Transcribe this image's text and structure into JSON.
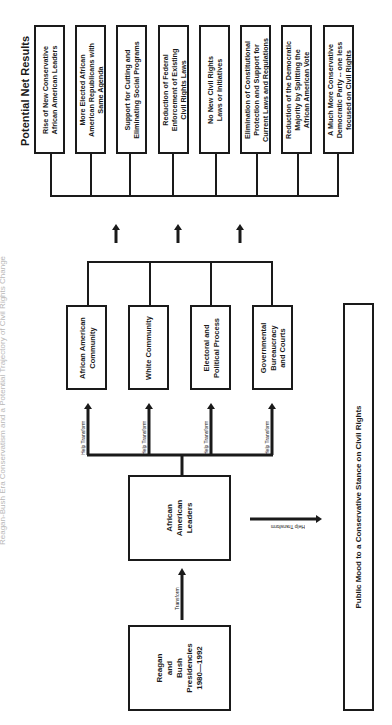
{
  "title": "Reagan-Bush Era Conservatism and a Potential Trajectory of Civil Rights Change",
  "results_heading": "Potential Net Results",
  "results": [
    {
      "line1": "Rise of New Conservative",
      "line2": "African American Leaders",
      "line3": ""
    },
    {
      "line1": "More Elected African",
      "line2": "American Republicans with",
      "line3": "Same Agenda"
    },
    {
      "line1": "Support for Cutting and",
      "line2": "Eliminating Social Programs",
      "line3": ""
    },
    {
      "line1": "Reduction of Federal",
      "line2": "Enforcement of Existing",
      "line3": "Civil Rights Laws"
    },
    {
      "line1": "No New Civil Rights",
      "line2": "Laws or Initiatives",
      "line3": ""
    },
    {
      "line1": "Elimination of Constitutional",
      "line2": "Protection and Support for",
      "line3": "Current Laws and Regulations"
    },
    {
      "line1": "Reduction of the Democratic",
      "line2": "Majority by Splitting the",
      "line3": "African American Vote"
    },
    {
      "line1": "A Much More Conservative",
      "line2": "Democratic Party -- one less",
      "line3": "focused on Civil Rights"
    }
  ],
  "targets": [
    {
      "line1": "African American",
      "line2": "Community",
      "line3": ""
    },
    {
      "line1": "White Community",
      "line2": "",
      "line3": ""
    },
    {
      "line1": "Electoral and",
      "line2": "Political Process",
      "line3": ""
    },
    {
      "line1": "Governmental",
      "line2": "Bureaucracy",
      "line3": "and Courts"
    }
  ],
  "help_transform_label": "Help Transform",
  "transform_label": "Transform",
  "leaders": {
    "line1": "African",
    "line2": "American",
    "line3": "Leaders"
  },
  "presidencies": {
    "line1": "Reagan",
    "line2": "and",
    "line3": "Bush",
    "line4": "Presidencies",
    "line5": "1980—1992"
  },
  "public_mood": "Public Mood to a Conservative Stance on Civil Rights"
}
